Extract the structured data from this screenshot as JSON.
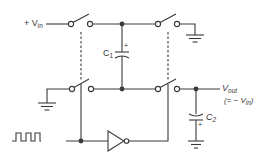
{
  "diagram": {
    "type": "switched-capacitor voltage inverter",
    "colors": {
      "line": "#3a3a3a",
      "background": "#ffffff"
    },
    "labels": {
      "vin_prefix": "+ V",
      "vin_sub": "in",
      "c1_main": "C",
      "c1_sub": "1",
      "c1_polarity": "+",
      "c2_main": "C",
      "c2_sub": "2",
      "c2_polarity": "+",
      "vout_main": "V",
      "vout_sub": "out",
      "vout_eq_prefix": "(= − V",
      "vout_eq_sub": "in",
      "vout_eq_suffix": ")"
    },
    "components": [
      {
        "id": "switch-top-left",
        "kind": "SPST switch"
      },
      {
        "id": "switch-top-right",
        "kind": "SPST switch"
      },
      {
        "id": "switch-bottom-left",
        "kind": "SPST switch"
      },
      {
        "id": "switch-bottom-right",
        "kind": "SPST switch"
      },
      {
        "id": "C1",
        "kind": "polarized capacitor"
      },
      {
        "id": "C2",
        "kind": "polarized capacitor"
      },
      {
        "id": "inverter",
        "kind": "NOT gate"
      },
      {
        "id": "clock",
        "kind": "square wave source"
      },
      {
        "id": "ground-top-right",
        "kind": "ground"
      },
      {
        "id": "ground-bottom-left",
        "kind": "ground"
      },
      {
        "id": "ground-c2",
        "kind": "ground"
      }
    ]
  }
}
